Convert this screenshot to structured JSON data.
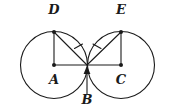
{
  "figure": {
    "background_color": "#ffffff",
    "stroke_color": "#1a1a1a",
    "labels": {
      "a": "A",
      "b": "B",
      "c": "C",
      "d": "D",
      "e": "E"
    },
    "points": {
      "A": {
        "x": 54,
        "y": 65,
        "role": "center-left-circle",
        "dot": true
      },
      "B": {
        "x": 87,
        "y": 65,
        "role": "tangency-point",
        "dot": false
      },
      "C": {
        "x": 121,
        "y": 65,
        "role": "center-right-circle",
        "dot": true
      },
      "D": {
        "x": 54,
        "y": 32,
        "role": "top-left-circle",
        "dot": true
      },
      "E": {
        "x": 121,
        "y": 32,
        "role": "top-right-circle",
        "dot": true
      }
    },
    "label_positions": {
      "A": {
        "x": 54,
        "y": 84
      },
      "B": {
        "x": 87,
        "y": 103
      },
      "C": {
        "x": 121,
        "y": 84
      },
      "D": {
        "x": 54,
        "y": 14
      },
      "E": {
        "x": 121,
        "y": 14
      }
    },
    "circles": [
      {
        "name": "left-circle",
        "cx": 54,
        "cy": 65,
        "r": 33.5
      },
      {
        "name": "right-circle",
        "cx": 121,
        "cy": 65,
        "r": 33.5
      }
    ],
    "segments": [
      {
        "name": "segment-AD",
        "x1": 54,
        "y1": 65,
        "x2": 54,
        "y2": 32
      },
      {
        "name": "segment-CE",
        "x1": 121,
        "y1": 65,
        "x2": 121,
        "y2": 32
      },
      {
        "name": "segment-AC",
        "x1": 54,
        "y1": 65,
        "x2": 121,
        "y2": 65
      },
      {
        "name": "segment-DB",
        "x1": 54,
        "y1": 32,
        "x2": 87,
        "y2": 65
      },
      {
        "name": "segment-EB",
        "x1": 121,
        "y1": 32,
        "x2": 87,
        "y2": 65
      }
    ],
    "tick_marks": [
      {
        "name": "tick-on-DB",
        "cx": 78.5,
        "cy": 48.5,
        "count": 1
      },
      {
        "name": "tick-on-EB",
        "cx": 97.5,
        "cy": 48.5,
        "count": 1
      }
    ],
    "pointer": {
      "name": "pointer-to-B",
      "from_x": 87,
      "from_y": 94,
      "to_x": 87,
      "to_y": 66
    }
  }
}
